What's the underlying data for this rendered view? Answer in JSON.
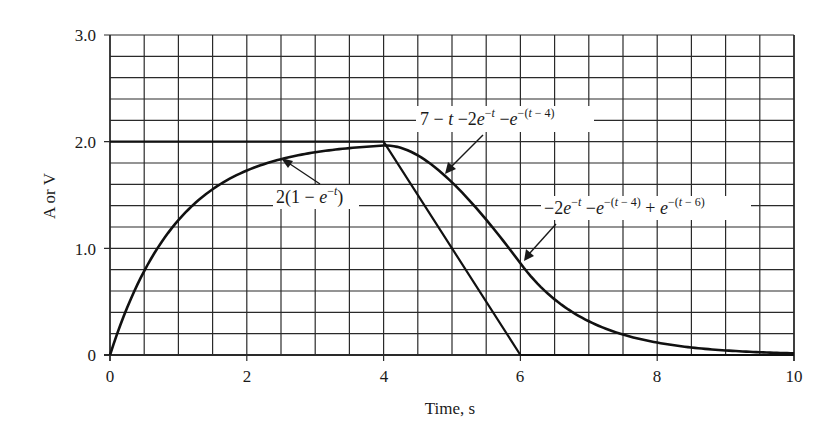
{
  "chart_data": {
    "type": "line",
    "title": "",
    "xlabel": "Time, s",
    "ylabel": "A or V",
    "xlim": [
      0,
      10
    ],
    "ylim": [
      0,
      3.0
    ],
    "grid": true,
    "x_ticks": [
      "0",
      "2",
      "4",
      "6",
      "8",
      "10"
    ],
    "y_ticks": [
      "0",
      "1.0",
      "2.0",
      "3.0"
    ],
    "grid_x_step": 0.5,
    "grid_y_step": 0.2,
    "series": [
      {
        "name": "input",
        "description": "trapezoidal input: 2 for 0-4 s, linear ramp down to 0 at 6 s, 0 afterward",
        "x": [
          0,
          4,
          6,
          10
        ],
        "values": [
          2.0,
          2.0,
          0.0,
          0.0
        ]
      },
      {
        "name": "response",
        "description": "piecewise response",
        "x": [
          0,
          0.5,
          1,
          1.5,
          2,
          2.5,
          3,
          3.5,
          4,
          4.5,
          5,
          5.5,
          6,
          6.5,
          7,
          7.5,
          8,
          8.5,
          9,
          9.5,
          10
        ],
        "values": [
          0,
          0.79,
          1.26,
          1.55,
          1.73,
          1.84,
          1.9,
          1.94,
          1.96,
          1.87,
          1.62,
          1.27,
          0.86,
          0.52,
          0.32,
          0.19,
          0.12,
          0.07,
          0.04,
          0.03,
          0.02
        ]
      }
    ],
    "annotations": [
      {
        "id": "seg1",
        "text": "2(1 − e^(−t))",
        "arrow_to": [
          2.5,
          1.84
        ]
      },
      {
        "id": "seg2",
        "text": "7 − t −2e^(−t) −e^(−(t − 4))",
        "arrow_to": [
          4.9,
          1.68
        ]
      },
      {
        "id": "seg3",
        "text": "−2e^(−t) −e^(−(t − 4)) + e^(−(t − 6))",
        "arrow_to": [
          6.0,
          0.86
        ]
      }
    ]
  },
  "labels": {
    "xlabel": "Time, s",
    "ylabel": "A or V",
    "xticks": [
      "0",
      "2",
      "4",
      "6",
      "8",
      "10"
    ],
    "yticks": [
      "0",
      "1.0",
      "2.0",
      "3.0"
    ]
  }
}
